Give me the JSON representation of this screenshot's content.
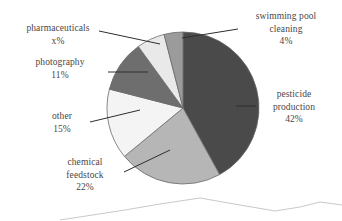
{
  "chart_data": {
    "type": "pie",
    "title": "",
    "subtitle": "",
    "xlabel": "",
    "ylabel": "",
    "legend_position": "callout-labels",
    "grid": false,
    "start_angle_deg": 0,
    "direction": "clockwise",
    "categories": [
      "pesticide production",
      "chemical feedstock",
      "other",
      "photography",
      "pharmaceuticals",
      "swimming pool cleaning"
    ],
    "values": [
      42,
      22,
      15,
      11,
      6,
      4
    ],
    "value_labels": [
      "42%",
      "22%",
      "15%",
      "11%",
      "x%",
      "4%"
    ],
    "colors": [
      "#4a4a4a",
      "#b6b6b6",
      "#f4f4f4",
      "#6e6e6e",
      "#e9e9e9",
      "#9b9b9b"
    ],
    "slices": [
      {
        "name": "pesticide production",
        "label_lines": [
          "pesticide",
          "production"
        ],
        "value_label": "42%",
        "value": 42,
        "color": "#4a4a4a",
        "start_deg": 0,
        "end_deg": 151.2
      },
      {
        "name": "chemical feedstock",
        "label_lines": [
          "chemical",
          "feedstock"
        ],
        "value_label": "22%",
        "value": 22,
        "color": "#b6b6b6",
        "start_deg": 151.2,
        "end_deg": 230.4
      },
      {
        "name": "other",
        "label_lines": [
          "other"
        ],
        "value_label": "15%",
        "value": 15,
        "color": "#f4f4f4",
        "start_deg": 230.4,
        "end_deg": 284.4
      },
      {
        "name": "photography",
        "label_lines": [
          "photography"
        ],
        "value_label": "11%",
        "value": 11,
        "color": "#6e6e6e",
        "start_deg": 284.4,
        "end_deg": 324.0
      },
      {
        "name": "pharmaceuticals",
        "label_lines": [
          "pharmaceuticals"
        ],
        "value_label": "x%",
        "value": 6,
        "color": "#e9e9e9",
        "start_deg": 324.0,
        "end_deg": 345.6
      },
      {
        "name": "swimming pool cleaning",
        "label_lines": [
          "swimming pool",
          "cleaning"
        ],
        "value_label": "4%",
        "value": 4,
        "color": "#9b9b9b",
        "start_deg": 345.6,
        "end_deg": 360.0
      }
    ]
  },
  "labels": {
    "pharmaceuticals": {
      "line1": "pharmaceuticals",
      "percent": "x%"
    },
    "photography": {
      "line1": "photography",
      "percent": "11%"
    },
    "other": {
      "line1": "other",
      "percent": "15%"
    },
    "chemical_feedstock": {
      "line1": "chemical",
      "line2": "feedstock",
      "percent": "22%"
    },
    "swimming_pool": {
      "line1": "swimming pool",
      "line2": "cleaning",
      "percent": "4%"
    },
    "pesticide": {
      "line1": "pesticide",
      "line2": "production",
      "percent": "42%"
    }
  },
  "style": {
    "background": "#ffffff",
    "text_color": "#4a4646",
    "outline_color": "#6a6a6a",
    "leader_color": "#2e2e2e"
  }
}
